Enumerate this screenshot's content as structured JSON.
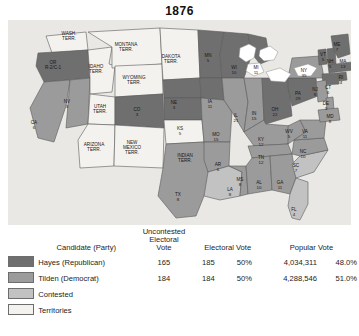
{
  "title": "1876",
  "colors": {
    "hayes": "#6f6f6f",
    "tilden": "#9b9b9b",
    "contested": "#c2c2c2",
    "territory": "#f3f2ee",
    "ocean": "#e9e8e4",
    "border": "#5a5a5a"
  },
  "legend": {
    "headers": {
      "candidate": "Candidate (Party)",
      "uncontested": "Uncontested Electoral Vote",
      "uncontested_l1": "Uncontested",
      "uncontested_l2": "Electoral",
      "uncontested_l3": "Vote",
      "electoral": "Electoral Vote",
      "popular": "Popular Vote"
    },
    "rows": [
      {
        "swatch": "hayes",
        "candidate": "Hayes (Republican)",
        "uncontested": "165",
        "electoral": "185",
        "electoral_pct": "50%",
        "popular": "4,034,311",
        "popular_pct": "48.0%"
      },
      {
        "swatch": "tilden",
        "candidate": "Tilden (Democrat)",
        "uncontested": "184",
        "electoral": "184",
        "electoral_pct": "50%",
        "popular": "4,288,546",
        "popular_pct": "51.0%"
      },
      {
        "swatch": "contested",
        "candidate": "Contested",
        "uncontested": "",
        "electoral": "",
        "electoral_pct": "",
        "popular": "",
        "popular_pct": ""
      },
      {
        "swatch": "territory",
        "candidate": "Territories",
        "uncontested": "",
        "electoral": "",
        "electoral_pct": "",
        "popular": "",
        "popular_pct": ""
      }
    ]
  },
  "map": {
    "states": [
      {
        "id": "WA",
        "label": "WASH.",
        "label2": "TERR.",
        "votes": "",
        "fill": "territory",
        "x": 61,
        "y": 16,
        "terr": true
      },
      {
        "id": "OR",
        "label": "OR",
        "label2": "R-2/C-1",
        "votes": "",
        "fill": "hayes",
        "x": 45,
        "y": 45,
        "terr": false
      },
      {
        "id": "CA",
        "label": "CA",
        "votes": "6",
        "fill": "tilden",
        "x": 26,
        "y": 105,
        "terr": false
      },
      {
        "id": "NV",
        "label": "NV",
        "votes": "3",
        "fill": "tilden",
        "x": 59,
        "y": 84,
        "terr": false
      },
      {
        "id": "ID",
        "label": "IDAHO",
        "label2": "TERR.",
        "votes": "",
        "fill": "territory",
        "x": 88,
        "y": 49,
        "terr": true
      },
      {
        "id": "MT",
        "label": "MONTANA",
        "label2": "TERR.",
        "votes": "",
        "fill": "territory",
        "x": 118,
        "y": 27,
        "terr": true
      },
      {
        "id": "WY",
        "label": "WYOMING",
        "label2": "TERR.",
        "votes": "",
        "fill": "territory",
        "x": 126,
        "y": 60,
        "terr": true
      },
      {
        "id": "UT",
        "label": "UTAH",
        "label2": "TERR.",
        "votes": "",
        "fill": "territory",
        "x": 92,
        "y": 89,
        "terr": true
      },
      {
        "id": "CO",
        "label": "CO",
        "votes": "3",
        "fill": "hayes",
        "x": 129,
        "y": 92,
        "terr": false
      },
      {
        "id": "AZ",
        "label": "ARIZONA",
        "label2": "TERR.",
        "votes": "",
        "fill": "territory",
        "x": 86,
        "y": 127,
        "terr": true
      },
      {
        "id": "NM",
        "label": "NEW",
        "label2": "MEXICO",
        "label3": "TERR.",
        "votes": "",
        "fill": "territory",
        "x": 124,
        "y": 128,
        "terr": true
      },
      {
        "id": "DT",
        "label": "DAKOTA",
        "label2": "TERR.",
        "votes": "",
        "fill": "territory",
        "x": 163,
        "y": 39,
        "terr": true
      },
      {
        "id": "NE",
        "label": "NE",
        "votes": "3",
        "fill": "hayes",
        "x": 166,
        "y": 85,
        "terr": false
      },
      {
        "id": "KS",
        "label": "KS",
        "votes": "5",
        "fill": "hayes",
        "x": 172,
        "y": 111,
        "terr": false
      },
      {
        "id": "IT",
        "label": "INDIAN",
        "label2": "TERR.",
        "votes": "",
        "fill": "territory",
        "x": 177,
        "y": 138,
        "terr": true
      },
      {
        "id": "TX",
        "label": "TX",
        "votes": "8",
        "fill": "tilden",
        "x": 170,
        "y": 177,
        "terr": false
      },
      {
        "id": "MN",
        "label": "MN",
        "votes": "5",
        "fill": "hayes",
        "x": 200,
        "y": 38,
        "terr": false
      },
      {
        "id": "IA",
        "label": "IA",
        "votes": "11",
        "fill": "hayes",
        "x": 202,
        "y": 84,
        "terr": false
      },
      {
        "id": "MO",
        "label": "MO",
        "votes": "15",
        "fill": "tilden",
        "x": 208,
        "y": 117,
        "terr": false
      },
      {
        "id": "AR",
        "label": "AR",
        "votes": "6",
        "fill": "tilden",
        "x": 210,
        "y": 147,
        "terr": false
      },
      {
        "id": "LA",
        "label": "LA",
        "votes": "8",
        "fill": "contested",
        "x": 222,
        "y": 172,
        "terr": false
      },
      {
        "id": "WI",
        "label": "WI",
        "votes": "10",
        "fill": "hayes",
        "x": 226,
        "y": 50,
        "terr": false
      },
      {
        "id": "IL",
        "label": "IL",
        "votes": "21",
        "fill": "tilden",
        "x": 228,
        "y": 98,
        "terr": false
      },
      {
        "id": "MS",
        "label": "MS",
        "votes": "8",
        "fill": "tilden",
        "x": 232,
        "y": 162,
        "terr": false
      },
      {
        "id": "MI",
        "label": "MI",
        "votes": "11",
        "fill": "hayes",
        "x": 248,
        "y": 50,
        "terr": false
      },
      {
        "id": "IN",
        "label": "IN",
        "votes": "15",
        "fill": "tilden",
        "x": 246,
        "y": 96,
        "terr": false
      },
      {
        "id": "KY",
        "label": "KY",
        "votes": "12",
        "fill": "tilden",
        "x": 253,
        "y": 122,
        "terr": false
      },
      {
        "id": "TN",
        "label": "TN",
        "votes": "12",
        "fill": "tilden",
        "x": 253,
        "y": 140,
        "terr": false
      },
      {
        "id": "AL",
        "label": "AL",
        "votes": "10",
        "fill": "tilden",
        "x": 251,
        "y": 165,
        "terr": false
      },
      {
        "id": "GA",
        "label": "GA",
        "votes": "11",
        "fill": "tilden",
        "x": 272,
        "y": 165,
        "terr": false
      },
      {
        "id": "OH",
        "label": "OH",
        "votes": "22",
        "fill": "hayes",
        "x": 267,
        "y": 92,
        "terr": false
      },
      {
        "id": "WV",
        "label": "WV",
        "votes": "5",
        "fill": "tilden",
        "x": 281,
        "y": 114,
        "terr": false
      },
      {
        "id": "FL",
        "label": "FL",
        "votes": "4",
        "fill": "contested",
        "x": 286,
        "y": 192,
        "terr": false
      },
      {
        "id": "SC",
        "label": "SC",
        "votes": "7",
        "fill": "contested",
        "x": 288,
        "y": 148,
        "terr": false
      },
      {
        "id": "NC",
        "label": "NC",
        "votes": "10",
        "fill": "tilden",
        "x": 295,
        "y": 134,
        "terr": false
      },
      {
        "id": "VA",
        "label": "VA",
        "votes": "11",
        "fill": "tilden",
        "x": 297,
        "y": 114,
        "terr": false
      },
      {
        "id": "PA",
        "label": "PA",
        "votes": "29",
        "fill": "hayes",
        "x": 290,
        "y": 76,
        "terr": false
      },
      {
        "id": "NY",
        "label": "NY",
        "votes": "35",
        "fill": "tilden",
        "x": 296,
        "y": 53,
        "terr": false
      },
      {
        "id": "VT",
        "label": "VT",
        "votes": "5",
        "fill": "hayes",
        "x": 315,
        "y": 37,
        "terr": false
      },
      {
        "id": "NH",
        "label": "NH",
        "votes": "5",
        "fill": "hayes",
        "x": 322,
        "y": 44,
        "terr": false
      },
      {
        "id": "ME",
        "label": "ME",
        "votes": "7",
        "fill": "hayes",
        "x": 329,
        "y": 27,
        "terr": false
      },
      {
        "id": "MA",
        "label": "MA",
        "votes": "13",
        "fill": "hayes",
        "x": 335,
        "y": 44,
        "terr": false
      },
      {
        "id": "RI",
        "label": "RI",
        "votes": "4",
        "fill": "hayes",
        "x": 333,
        "y": 60,
        "terr": false
      },
      {
        "id": "CT",
        "label": "CT",
        "votes": "6",
        "fill": "hayes",
        "x": 320,
        "y": 70,
        "terr": false
      },
      {
        "id": "NJ",
        "label": "NJ",
        "votes": "9",
        "fill": "tilden",
        "x": 307,
        "y": 72,
        "terr": false
      },
      {
        "id": "DE",
        "label": "DE",
        "votes": "3",
        "fill": "tilden",
        "x": 318,
        "y": 86,
        "terr": false
      },
      {
        "id": "MD",
        "label": "MD",
        "votes": "8",
        "fill": "tilden",
        "x": 322,
        "y": 99,
        "terr": false
      }
    ]
  }
}
